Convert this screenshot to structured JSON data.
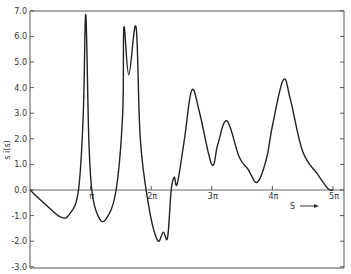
{
  "chart_data": {
    "type": "line",
    "title": "",
    "xlabel": "S",
    "xlabel_arrow": "→",
    "ylabel": "s i(s)",
    "xlim": [
      0,
      5
    ],
    "x_unit": "π",
    "ylim": [
      -3.0,
      7.0
    ],
    "grid": false,
    "legend": null,
    "x_ticks": [
      {
        "value": 1,
        "label": "π"
      },
      {
        "value": 2,
        "label": "2π"
      },
      {
        "value": 3,
        "label": "3π"
      },
      {
        "value": 4,
        "label": "4π"
      },
      {
        "value": 5,
        "label": "5π"
      }
    ],
    "y_ticks": [
      {
        "value": 7,
        "label": "7.0"
      },
      {
        "value": 6,
        "label": "6.0"
      },
      {
        "value": 5,
        "label": "5.0"
      },
      {
        "value": 4,
        "label": "4.0"
      },
      {
        "value": 3,
        "label": "3.0"
      },
      {
        "value": 2,
        "label": "2.0"
      },
      {
        "value": 1,
        "label": "1.0"
      },
      {
        "value": 0,
        "label": "0.0"
      },
      {
        "value": -1,
        "label": "-1.0"
      },
      {
        "value": -2,
        "label": "-2.0"
      },
      {
        "value": -3,
        "label": "-3.0"
      }
    ],
    "series": [
      {
        "name": "s i(s)",
        "x": [
          0,
          0.25,
          0.5,
          0.65,
          0.8,
          0.88,
          0.92,
          0.97,
          1.02,
          1.12,
          1.25,
          1.42,
          1.53,
          1.55,
          1.63,
          1.75,
          1.82,
          1.95,
          2.1,
          2.2,
          2.27,
          2.33,
          2.38,
          2.43,
          2.55,
          2.67,
          2.8,
          3.0,
          3.1,
          3.25,
          3.45,
          3.6,
          3.75,
          3.9,
          4.0,
          4.18,
          4.3,
          4.5,
          4.75,
          4.92,
          5.0
        ],
        "values": [
          0,
          -0.55,
          -1.05,
          -0.95,
          0,
          3.0,
          6.85,
          2.0,
          0,
          -1.0,
          -1.15,
          0,
          3.0,
          6.35,
          4.5,
          6.35,
          2.0,
          -0.5,
          -1.95,
          -1.65,
          -1.85,
          0,
          0.5,
          0.25,
          2.0,
          3.9,
          3.0,
          1.0,
          1.8,
          2.7,
          1.3,
          0.8,
          0.3,
          1.2,
          2.5,
          4.3,
          3.5,
          1.5,
          0.6,
          0.05,
          0
        ]
      }
    ]
  }
}
